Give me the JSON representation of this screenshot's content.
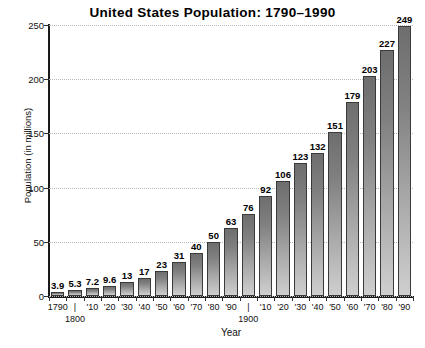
{
  "chart_data": {
    "type": "bar",
    "title": "United States Population: 1790–1990",
    "xlabel": "Year",
    "ylabel": "Population (in millions)",
    "ylim": [
      0,
      250
    ],
    "yticks": [
      0,
      50,
      100,
      150,
      200,
      250
    ],
    "grid": true,
    "legend": null,
    "categories": [
      "1790",
      "1800",
      "'10",
      "'20",
      "'30",
      "'40",
      "'50",
      "'60",
      "'70",
      "'80",
      "'90",
      "1900",
      "'10",
      "'20",
      "'30",
      "'40",
      "'50",
      "'60",
      "'70",
      "'80",
      "'90"
    ],
    "values": [
      3.9,
      5.3,
      7.2,
      9.6,
      13,
      17,
      23,
      31,
      40,
      50,
      63,
      76,
      92,
      106,
      123,
      132,
      151,
      179,
      203,
      227,
      249
    ],
    "value_labels": [
      "3.9",
      "5.3",
      "7.2",
      "9.6",
      "13",
      "17",
      "23",
      "31",
      "40",
      "50",
      "63",
      "76",
      "92",
      "106",
      "123",
      "132",
      "151",
      "179",
      "203",
      "227",
      "249"
    ],
    "x_axis_ticks": [
      {
        "label": "1790",
        "sublabel": ""
      },
      {
        "label": "|",
        "sublabel": "1800"
      },
      {
        "label": "'10",
        "sublabel": ""
      },
      {
        "label": "'20",
        "sublabel": ""
      },
      {
        "label": "'30",
        "sublabel": ""
      },
      {
        "label": "'40",
        "sublabel": ""
      },
      {
        "label": "'50",
        "sublabel": ""
      },
      {
        "label": "'60",
        "sublabel": ""
      },
      {
        "label": "'70",
        "sublabel": ""
      },
      {
        "label": "'80",
        "sublabel": ""
      },
      {
        "label": "'90",
        "sublabel": ""
      },
      {
        "label": "|",
        "sublabel": "1900"
      },
      {
        "label": "'10",
        "sublabel": ""
      },
      {
        "label": "'20",
        "sublabel": ""
      },
      {
        "label": "'30",
        "sublabel": ""
      },
      {
        "label": "'40",
        "sublabel": ""
      },
      {
        "label": "'50",
        "sublabel": ""
      },
      {
        "label": "'60",
        "sublabel": ""
      },
      {
        "label": "'70",
        "sublabel": ""
      },
      {
        "label": "'80",
        "sublabel": ""
      },
      {
        "label": "'90",
        "sublabel": ""
      }
    ],
    "colors": {
      "bar_top": "#6e6e6e",
      "bar_bottom": "#cfcfcf",
      "bar_outline": "#3a3a3a",
      "gridline": "#b8b8b8",
      "axis": "#1a1a1a",
      "text": "#000000",
      "background": "#ffffff"
    }
  }
}
